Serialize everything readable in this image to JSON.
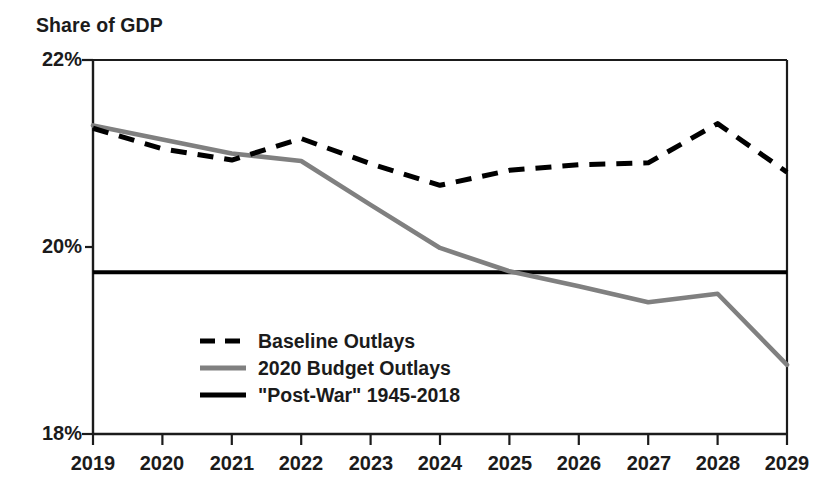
{
  "chart_data": {
    "type": "line",
    "title": "Share of GDP",
    "xlabel": "",
    "ylabel": "Share of GDP",
    "categories": [
      "2019",
      "2020",
      "2021",
      "2022",
      "2023",
      "2024",
      "2025",
      "2026",
      "2027",
      "2028",
      "2029"
    ],
    "x": [
      2019,
      2020,
      2021,
      2022,
      2023,
      2024,
      2025,
      2026,
      2027,
      2028,
      2029
    ],
    "ylim": [
      18,
      22
    ],
    "xlim": [
      2019,
      2029
    ],
    "ytick_labels": [
      "22%",
      "20%",
      "18%"
    ],
    "ytick_values": [
      22,
      20,
      18
    ],
    "grid": false,
    "legend_position": "inside-lower-left",
    "series": [
      {
        "name": "Baseline Outlays",
        "style": "dashed",
        "color": "#000000",
        "values": [
          21.27,
          21.05,
          20.93,
          21.16,
          20.89,
          20.66,
          20.82,
          20.88,
          20.9,
          21.32,
          20.8
        ]
      },
      {
        "name": "2020 Budget Outlays",
        "style": "solid",
        "color": "#808080",
        "values": [
          21.3,
          21.15,
          21.0,
          20.92,
          20.45,
          19.99,
          19.74,
          19.58,
          19.41,
          19.5,
          18.74
        ]
      },
      {
        "name": "\"Post-War\" 1945-2018",
        "style": "solid-horizontal",
        "color": "#000000",
        "constant_value": 19.73,
        "values": [
          19.73,
          19.73,
          19.73,
          19.73,
          19.73,
          19.73,
          19.73,
          19.73,
          19.73,
          19.73,
          19.73
        ]
      }
    ]
  },
  "legend": {
    "items": [
      {
        "label": "Baseline Outlays",
        "swatch": "dashed-black"
      },
      {
        "label": "2020 Budget Outlays",
        "swatch": "solid-gray"
      },
      {
        "label": "\"Post-War\" 1945-2018",
        "swatch": "solid-black"
      }
    ]
  },
  "colors": {
    "baseline": "#000000",
    "budget": "#808080",
    "postwar": "#000000",
    "axis": "#1b1b1b",
    "background": "#ffffff"
  }
}
